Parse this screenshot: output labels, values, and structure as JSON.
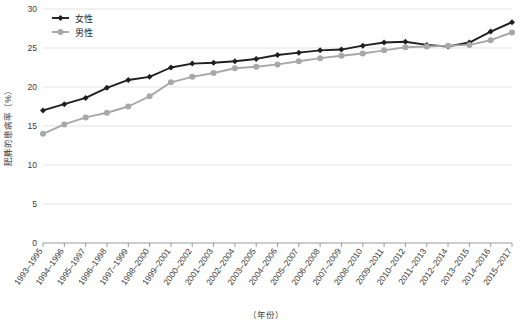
{
  "chart_data": {
    "type": "line",
    "title": "",
    "xlabel": "（年份）",
    "ylabel": "肥胖的患病率（%）",
    "ylim": [
      0,
      30
    ],
    "ytick_values": [
      0,
      5,
      10,
      15,
      20,
      25,
      30
    ],
    "ytick_labels": [
      "0",
      "5",
      "10",
      "15",
      "20",
      "25",
      "30"
    ],
    "grid": true,
    "legend_position": "top-left",
    "categories": [
      "1993–1995",
      "1994–1996",
      "1995–1997",
      "1996–1998",
      "1997–1999",
      "1998–2000",
      "1999–2001",
      "2000–2002",
      "2001–2003",
      "2002–2004",
      "2003–2005",
      "2004–2006",
      "2005–2007",
      "2006–2008",
      "2007–2009",
      "2008–2010",
      "2009–2011",
      "2010–2012",
      "2011–2013",
      "2012–2014",
      "2013–2015",
      "2014–2016",
      "2015–2017"
    ],
    "series": [
      {
        "name": "女性",
        "color": "#1f1f1f",
        "marker": "diamond",
        "values": [
          17.0,
          17.8,
          18.6,
          19.9,
          20.9,
          21.3,
          22.5,
          23.0,
          23.1,
          23.3,
          23.6,
          24.1,
          24.4,
          24.7,
          24.8,
          25.3,
          25.7,
          25.8,
          25.4,
          25.2,
          25.7,
          27.1,
          28.3
        ]
      },
      {
        "name": "男性",
        "color": "#a8a8a8",
        "marker": "circle",
        "values": [
          14.0,
          15.2,
          16.1,
          16.7,
          17.5,
          18.8,
          20.6,
          21.3,
          21.8,
          22.4,
          22.6,
          22.9,
          23.3,
          23.7,
          24.0,
          24.3,
          24.7,
          25.1,
          25.2,
          25.3,
          25.4,
          26.0,
          27.0
        ]
      }
    ]
  },
  "legend": {
    "items": [
      {
        "label": "女性"
      },
      {
        "label": "男性"
      }
    ]
  }
}
